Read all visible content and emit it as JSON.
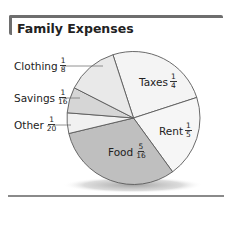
{
  "title": "Family Expenses",
  "colors": {
    "frame": "#6e6e6e",
    "outline": "#5a5a5a",
    "shadow": "#bcbcbc"
  },
  "labels": {
    "clothing": {
      "name": "Clothing",
      "num": "1",
      "den": "8"
    },
    "savings": {
      "name": "Savings",
      "num": "1",
      "den": "16"
    },
    "other": {
      "name": "Other",
      "num": "1",
      "den": "20"
    },
    "taxes": {
      "name": "Taxes",
      "num": "1",
      "den": "4"
    },
    "rent": {
      "name": "Rent",
      "num": "1",
      "den": "5"
    },
    "food": {
      "name": "Food",
      "num": "5",
      "den": "16"
    }
  },
  "chart_data": {
    "type": "pie",
    "title": "Family Expenses",
    "categories": [
      "Taxes",
      "Rent",
      "Food",
      "Other",
      "Savings",
      "Clothing"
    ],
    "values": [
      0.25,
      0.2,
      0.3125,
      0.05,
      0.0625,
      0.125
    ],
    "value_labels": [
      "1/4",
      "1/5",
      "5/16",
      "1/20",
      "1/16",
      "1/8"
    ],
    "slice_colors": [
      "#f4f4f4",
      "#f6f6f6",
      "#bfbfbf",
      "#f1f1f1",
      "#d6d6d6",
      "#e9e9e9"
    ],
    "start_angle_deg": -18,
    "direction": "clockwise",
    "legend": "none (direct labels)"
  }
}
